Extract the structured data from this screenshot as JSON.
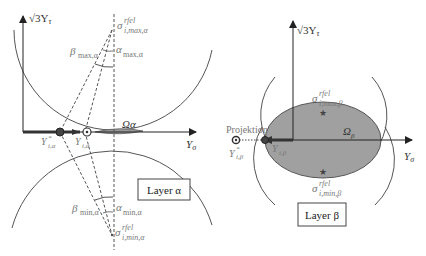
{
  "colors": {
    "line": "#555555",
    "axis": "#222222",
    "fill": "#999999",
    "label": "#777777",
    "dark_label": "#333333"
  },
  "panel_alpha": {
    "y_axis_label": "√3Y",
    "y_axis_sub": "τ",
    "x_axis_label": "Y",
    "x_axis_sub": "σ",
    "sigma_max": {
      "base": "σ",
      "sup": "rfel",
      "sub": "i,max,α"
    },
    "sigma_min": {
      "base": "σ",
      "sup": "rfel",
      "sub": "i,min,α"
    },
    "beta_max": {
      "base": "β",
      "sub": "max,α"
    },
    "alpha_max": {
      "base": "α",
      "sub": "max,α"
    },
    "beta_min": {
      "base": "β",
      "sub": "min,α"
    },
    "alpha_min": {
      "base": "α",
      "sub": "min,α"
    },
    "region": "Ωα",
    "point_star": {
      "base": "Y",
      "sup": "*",
      "sub": "i,α"
    },
    "point": {
      "base": "Y",
      "sub": "i,α"
    },
    "layer_box": "Layer α"
  },
  "panel_beta": {
    "y_axis_label": "√3Y",
    "y_axis_sub": "τ",
    "x_axis_label": "Y",
    "x_axis_sub": "σ",
    "sigma_max": {
      "base": "σ",
      "sup": "rfel",
      "sub": "i,max,β"
    },
    "sigma_min": {
      "base": "σ",
      "sup": "rfel",
      "sub": "i,min,β"
    },
    "region": {
      "base": "Ω",
      "sub": "β"
    },
    "projection_label": "Projektion",
    "point_star": {
      "base": "Y",
      "sup": "*",
      "sub": "i,β"
    },
    "point": {
      "base": "Y",
      "sub": "i,β"
    },
    "layer_box": "Layer β"
  }
}
